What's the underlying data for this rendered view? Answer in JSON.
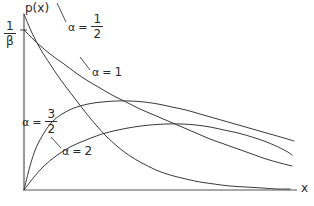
{
  "figure": {
    "background_color": "#ffffff",
    "line_color": "#3a3a3a",
    "axis_color": "#555555",
    "text_color": "#2a2a2a"
  },
  "axes": {
    "y_axis_label": "p(x)",
    "x_axis_label": "x",
    "y_tick_label": {
      "numerator": "1",
      "denominator": "β"
    },
    "origin": {
      "x": 24,
      "y": 190
    },
    "x_axis_end": {
      "x": 297,
      "y": 190
    },
    "y_axis_top": {
      "x": 24,
      "y": 14
    }
  },
  "labels": {
    "alpha_half": {
      "symbol": "α",
      "equals": "=",
      "numerator": "1",
      "denominator": "2"
    },
    "alpha_one": {
      "symbol": "α",
      "equals": "=",
      "value": "1"
    },
    "alpha_three_halves": {
      "symbol": "α",
      "equals": "=",
      "numerator": "3",
      "denominator": "2"
    },
    "alpha_two": {
      "symbol": "α",
      "equals": "=",
      "value": "2"
    }
  },
  "chart_data": {
    "type": "line",
    "title": "",
    "xlabel": "x",
    "ylabel": "p(x)",
    "grid": false,
    "legend_position": "inline-annotations",
    "xlim": [
      0,
      1
    ],
    "ylim": [
      0,
      1
    ],
    "y_tick_values": [
      1
    ],
    "y_tick_labels": [
      "1/β"
    ],
    "x_tick_labels": [],
    "series": [
      {
        "name": "α = 1/2",
        "label": "alpha_half",
        "points": [
          [
            24,
            14
          ],
          [
            32,
            33
          ],
          [
            41,
            50
          ],
          [
            50,
            64
          ],
          [
            58,
            76
          ],
          [
            66,
            87
          ],
          [
            76,
            100
          ],
          [
            86,
            113
          ],
          [
            96,
            125
          ],
          [
            106,
            136
          ],
          [
            118,
            147
          ],
          [
            130,
            156
          ],
          [
            142,
            163
          ],
          [
            156,
            170
          ],
          [
            170,
            175
          ],
          [
            186,
            179
          ],
          [
            200,
            182
          ],
          [
            214,
            184
          ],
          [
            230,
            186
          ],
          [
            246,
            187
          ],
          [
            262,
            188
          ],
          [
            278,
            189
          ],
          [
            290,
            189
          ]
        ]
      },
      {
        "name": "α = 1",
        "label": "alpha_one",
        "points": [
          [
            24,
            30
          ],
          [
            34,
            40
          ],
          [
            44,
            49
          ],
          [
            54,
            57
          ],
          [
            64,
            64
          ],
          [
            76,
            73
          ],
          [
            88,
            81
          ],
          [
            100,
            88
          ],
          [
            112,
            95
          ],
          [
            126,
            102
          ],
          [
            140,
            109
          ],
          [
            154,
            115
          ],
          [
            168,
            121
          ],
          [
            182,
            127
          ],
          [
            196,
            133
          ],
          [
            210,
            139
          ],
          [
            224,
            144
          ],
          [
            238,
            149
          ],
          [
            252,
            154
          ],
          [
            266,
            159
          ],
          [
            280,
            163
          ],
          [
            292,
            166
          ]
        ]
      },
      {
        "name": "α = 3/2",
        "label": "alpha_three_halves",
        "points": [
          [
            24,
            190
          ],
          [
            30,
            166
          ],
          [
            36,
            148
          ],
          [
            44,
            133
          ],
          [
            52,
            122
          ],
          [
            62,
            114
          ],
          [
            74,
            108
          ],
          [
            88,
            104
          ],
          [
            102,
            102
          ],
          [
            116,
            101
          ],
          [
            130,
            101
          ],
          [
            144,
            102
          ],
          [
            158,
            104
          ],
          [
            172,
            107
          ],
          [
            186,
            110
          ],
          [
            200,
            114
          ],
          [
            214,
            118
          ],
          [
            228,
            122
          ],
          [
            242,
            126
          ],
          [
            256,
            130
          ],
          [
            270,
            134
          ],
          [
            284,
            138
          ],
          [
            294,
            141
          ]
        ]
      },
      {
        "name": "α = 2",
        "label": "alpha_two",
        "points": [
          [
            24,
            190
          ],
          [
            34,
            177
          ],
          [
            44,
            166
          ],
          [
            56,
            156
          ],
          [
            70,
            147
          ],
          [
            86,
            140
          ],
          [
            102,
            134
          ],
          [
            118,
            130
          ],
          [
            134,
            127
          ],
          [
            150,
            125
          ],
          [
            166,
            124
          ],
          [
            182,
            124
          ],
          [
            196,
            125
          ],
          [
            210,
            127
          ],
          [
            224,
            130
          ],
          [
            238,
            133
          ],
          [
            252,
            137
          ],
          [
            264,
            141
          ],
          [
            276,
            146
          ],
          [
            286,
            151
          ],
          [
            292,
            155
          ]
        ]
      }
    ]
  }
}
